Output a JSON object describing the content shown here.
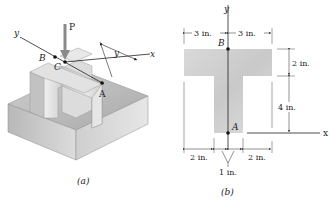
{
  "figure_a": {
    "caption": "(a)",
    "load_label": "P",
    "axis_y_label": "y",
    "axis_x_label": "x",
    "offset_label": "y",
    "points": [
      {
        "label": "B"
      },
      {
        "label": "C"
      },
      {
        "label": "A"
      }
    ]
  },
  "figure_b": {
    "caption": "(b)",
    "axis_y_label": "y",
    "axis_x_label": "x",
    "points": [
      {
        "label": "B"
      },
      {
        "label": "A"
      }
    ],
    "dimensions": {
      "top_left": "3 in.",
      "top_right": "3 in.",
      "flange_height": "2 in.",
      "web_height": "4 in.",
      "bottom_left": "2 in.",
      "bottom_right": "2 in.",
      "web_width": "1 in."
    }
  },
  "colors": {
    "section_fill": "#d4d4d4",
    "line": "#222222",
    "arrow": "#8a8a8a"
  }
}
